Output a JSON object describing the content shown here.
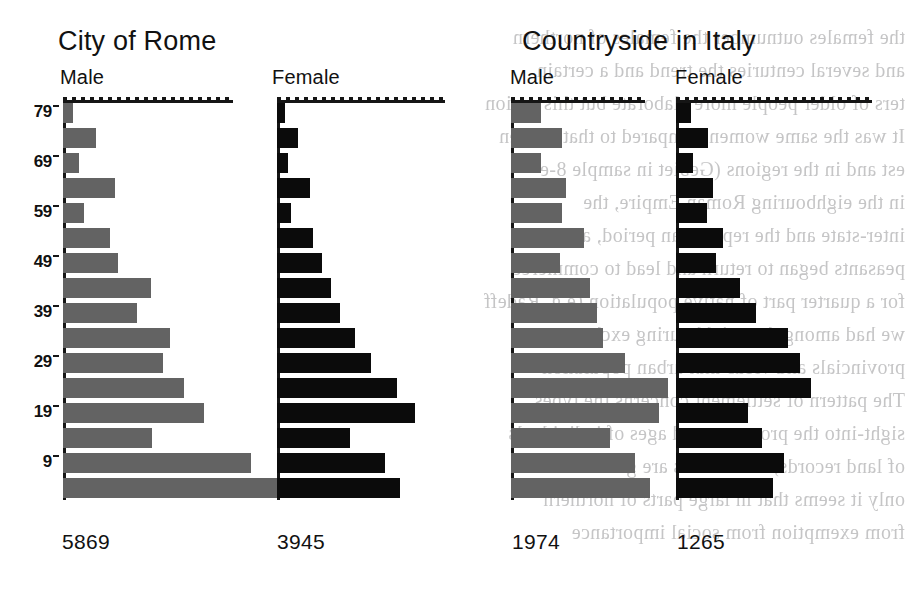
{
  "figure": {
    "background_color": "#ffffff",
    "male_bar_color": "#636363",
    "female_bar_color": "#0b0b0b",
    "axis_color": "#151515"
  },
  "panels": [
    {
      "title": "City of Rome",
      "male_label": "Male",
      "female_label": "Female",
      "male_total": "5869",
      "female_total": "3945"
    },
    {
      "title": "Countryside in Italy",
      "male_label": "Male",
      "female_label": "Female",
      "male_total": "1974",
      "female_total": "1265"
    }
  ],
  "axis": {
    "tick_labels": [
      "79",
      "69",
      "59",
      "49",
      "39",
      "29",
      "19",
      "9"
    ]
  },
  "chart_data": {
    "type": "bar",
    "subtype": "population-pyramid (horizontal bars, age on y-axis, count on x-axis)",
    "xlabel": "",
    "ylabel": "Age",
    "grid": false,
    "legend_position": "none",
    "age_groups": [
      "0-4",
      "5-9",
      "10-14",
      "15-19",
      "20-24",
      "25-29",
      "30-34",
      "35-39",
      "40-44",
      "45-49",
      "50-54",
      "55-59",
      "60-64",
      "65-69",
      "70-74",
      "75-79"
    ],
    "age_groups_top_to_bottom": [
      "75-79",
      "70-74",
      "65-69",
      "60-64",
      "55-59",
      "50-54",
      "45-49",
      "40-44",
      "35-39",
      "30-34",
      "25-29",
      "20-24",
      "15-19",
      "10-14",
      "5-9",
      "0-4"
    ],
    "y_tick_labels": [
      "79",
      "69",
      "59",
      "49",
      "39",
      "29",
      "19",
      "9"
    ],
    "series": [
      {
        "name": "City of Rome - Male",
        "panel": "City of Rome",
        "sex": "Male",
        "color": "#636363",
        "total": 5869,
        "values_top_to_bottom": [
          18,
          66,
          30,
          108,
          42,
          96,
          114,
          186,
          156,
          228,
          210,
          258,
          300,
          186,
          402,
          462
        ],
        "bar_px_top_to_bottom": [
          10,
          33,
          16,
          52,
          21,
          47,
          55,
          88,
          74,
          107,
          100,
          121,
          141,
          89,
          188,
          216
        ]
      },
      {
        "name": "City of Rome - Female",
        "panel": "City of Rome",
        "sex": "Female",
        "color": "#0b0b0b",
        "total": 3945,
        "values_top_to_bottom": [
          16,
          42,
          22,
          66,
          28,
          72,
          92,
          110,
          130,
          160,
          192,
          246,
          282,
          150,
          222,
          252
        ],
        "bar_px_top_to_bottom": [
          8,
          21,
          11,
          33,
          14,
          36,
          45,
          54,
          63,
          78,
          94,
          120,
          138,
          73,
          108,
          123
        ]
      },
      {
        "name": "Countryside in Italy - Male",
        "panel": "Countryside in Italy",
        "sex": "Male",
        "color": "#636363",
        "total": 1974,
        "values_top_to_bottom": [
          30,
          54,
          32,
          58,
          54,
          78,
          52,
          84,
          92,
          98,
          122,
          168,
          158,
          106,
          132,
          148
        ],
        "bar_px_top_to_bottom": [
          30,
          51,
          30,
          55,
          51,
          73,
          49,
          79,
          86,
          92,
          114,
          157,
          148,
          99,
          124,
          139
        ]
      },
      {
        "name": "Countryside in Italy - Female",
        "panel": "Countryside in Italy",
        "sex": "Female",
        "color": "#0b0b0b",
        "total": 1265,
        "values_top_to_bottom": [
          10,
          22,
          12,
          26,
          22,
          34,
          28,
          46,
          58,
          82,
          90,
          98,
          52,
          62,
          78,
          70
        ],
        "bar_px_top_to_bottom": [
          15,
          32,
          17,
          37,
          31,
          47,
          40,
          64,
          80,
          112,
          124,
          135,
          72,
          86,
          108,
          97
        ]
      }
    ]
  }
}
